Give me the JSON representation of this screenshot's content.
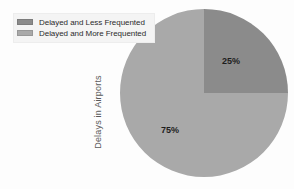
{
  "chart_data": {
    "type": "pie",
    "title": "",
    "subtitle": "",
    "xlabel": "",
    "ylabel": "Delays in Airports",
    "series_name": "Delays in Airports",
    "legend_position": "top-left",
    "grid": false,
    "categories": [
      "Delayed and Less Frequented",
      "Delayed and More Frequented"
    ],
    "values": [
      25,
      75
    ],
    "value_labels": [
      "25%",
      "75%"
    ],
    "colors": [
      "#8b8b8b",
      "#a9a9a9"
    ],
    "slices": [
      {
        "label": "Delayed and Less Frequented",
        "value": 25,
        "value_label": "25%",
        "color": "#8b8b8b",
        "start_angle_deg": 0,
        "end_angle_deg": 90
      },
      {
        "label": "Delayed and More Frequented",
        "value": 75,
        "value_label": "75%",
        "color": "#a9a9a9",
        "start_angle_deg": 90,
        "end_angle_deg": 360
      }
    ]
  },
  "legend": {
    "items": [
      {
        "label": "Delayed and Less Frequented",
        "color": "#8b8b8b",
        "swatch_name": "legend-swatch-less-frequented"
      },
      {
        "label": "Delayed and More Frequented",
        "color": "#a9a9a9",
        "swatch_name": "legend-swatch-more-frequented"
      }
    ]
  },
  "axis": {
    "vertical_label": "Delays in Airports"
  },
  "labels": {
    "slice_25": "25%",
    "slice_75": "75%"
  },
  "colors": {
    "background": "#fdfdfd",
    "legend_background": "#f4f4f4",
    "slice_dark": "#8b8b8b",
    "slice_light": "#a9a9a9",
    "text": "#2b2b2b",
    "axis_text": "#5a5a5a"
  }
}
